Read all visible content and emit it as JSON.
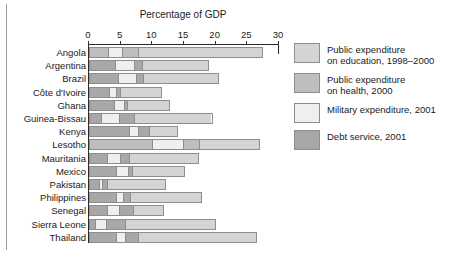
{
  "chart_data": {
    "type": "bar",
    "orientation": "horizontal",
    "stacked": true,
    "title": "Percentage of GDP",
    "xlabel": "Percentage of GDP",
    "ylabel": "",
    "xlim": [
      0,
      30
    ],
    "xticks": [
      0,
      5,
      10,
      15,
      20,
      25,
      30
    ],
    "xtick_labels": [
      "0",
      "5",
      "10",
      "15",
      "20",
      "25",
      "30"
    ],
    "grid": false,
    "legend_position": "right",
    "categories": [
      "Angola",
      "Argentina",
      "Brazil",
      "Côte d'Ivoire",
      "Ghana",
      "Guinea-Bissau",
      "Kenya",
      "Lesotho",
      "Mauritania",
      "Mexico",
      "Pakistan",
      "Philippines",
      "Senegal",
      "Sierra Leone",
      "Thailand"
    ],
    "series": [
      {
        "name": "Debt service, 2001",
        "key": "debt",
        "color": "#a8a8a8",
        "values": [
          3.0,
          4.2,
          4.7,
          3.2,
          4.1,
          2.0,
          6.4,
          0.0,
          2.9,
          4.3,
          1.6,
          4.4,
          3.0,
          1.0,
          4.3
        ]
      },
      {
        "name": "Military expenditure, 2001",
        "key": "military",
        "color": "#efefef",
        "values": [
          2.2,
          1.5,
          1.4,
          1.2,
          0.8,
          2.8,
          1.5,
          0.0,
          2.1,
          0.6,
          0.5,
          1.0,
          1.5,
          1.8,
          1.5
        ]
      },
      {
        "name": "Public expenditure on health, 2000",
        "key": "health",
        "color": "#bebebe",
        "values": [
          2.7,
          4.9,
          3.0,
          1.2,
          2.3,
          2.5,
          1.8,
          10.0,
          1.4,
          2.5,
          0.9,
          1.7,
          2.6,
          2.9,
          2.1
        ]
      },
      {
        "name": "Public expenditure on education, 1998–2000",
        "key": "education",
        "color": "#d4d4d4",
        "values": [
          19.6,
          8.4,
          11.4,
          5.9,
          5.6,
          12.2,
          4.4,
          17.0,
          10.9,
          7.8,
          9.2,
          10.7,
          4.8,
          14.3,
          18.6
        ]
      }
    ],
    "lesotho_segment_order": [
      "health",
      "military",
      "health",
      "education"
    ],
    "totals": [
      27.5,
      19.0,
      20.5,
      11.5,
      12.8,
      19.5,
      14.1,
      27.0,
      17.3,
      15.2,
      12.2,
      17.8,
      11.9,
      20.0,
      26.5
    ]
  },
  "chart": {
    "title": "Percentage of GDP",
    "ticks": [
      {
        "label": "0",
        "value": 0
      },
      {
        "label": "5",
        "value": 5
      },
      {
        "label": "10",
        "value": 10
      },
      {
        "label": "15",
        "value": 15
      },
      {
        "label": "20",
        "value": 20
      },
      {
        "label": "25",
        "value": 25
      },
      {
        "label": "30",
        "value": 30
      }
    ],
    "rows": [
      {
        "label": "Angola",
        "segments": [
          {
            "key": "health",
            "v": 3.0
          },
          {
            "key": "military",
            "v": 2.2
          },
          {
            "key": "health",
            "v": 2.7
          },
          {
            "key": "education",
            "v": 19.6
          }
        ]
      },
      {
        "label": "Argentina",
        "segments": [
          {
            "key": "debt",
            "v": 4.2
          },
          {
            "key": "military",
            "v": 3.0
          },
          {
            "key": "debt",
            "v": 1.3
          },
          {
            "key": "education",
            "v": 10.5
          }
        ]
      },
      {
        "label": "Brazil",
        "segments": [
          {
            "key": "debt",
            "v": 4.7
          },
          {
            "key": "military",
            "v": 2.9
          },
          {
            "key": "debt",
            "v": 1.0
          },
          {
            "key": "education",
            "v": 11.9
          }
        ]
      },
      {
        "label": "Côte d'Ivoire",
        "segments": [
          {
            "key": "debt",
            "v": 3.2
          },
          {
            "key": "military",
            "v": 1.2
          },
          {
            "key": "debt",
            "v": 0.6
          },
          {
            "key": "education",
            "v": 6.5
          }
        ]
      },
      {
        "label": "Ghana",
        "segments": [
          {
            "key": "debt",
            "v": 4.1
          },
          {
            "key": "military",
            "v": 1.5
          },
          {
            "key": "debt",
            "v": 0.5
          },
          {
            "key": "education",
            "v": 6.7
          }
        ]
      },
      {
        "label": "Guinea-Bissau",
        "segments": [
          {
            "key": "debt",
            "v": 2.0
          },
          {
            "key": "military",
            "v": 2.8
          },
          {
            "key": "debt",
            "v": 2.5
          },
          {
            "key": "education",
            "v": 12.2
          }
        ]
      },
      {
        "label": "Kenya",
        "segments": [
          {
            "key": "debt",
            "v": 6.4
          },
          {
            "key": "military",
            "v": 1.5
          },
          {
            "key": "debt",
            "v": 1.8
          },
          {
            "key": "education",
            "v": 4.4
          }
        ]
      },
      {
        "label": "Lesotho",
        "segments": [
          {
            "key": "health",
            "v": 10.0
          },
          {
            "key": "military",
            "v": 5.0
          },
          {
            "key": "health",
            "v": 2.5
          },
          {
            "key": "education",
            "v": 9.5
          }
        ]
      },
      {
        "label": "Mauritania",
        "segments": [
          {
            "key": "debt",
            "v": 2.9
          },
          {
            "key": "military",
            "v": 2.1
          },
          {
            "key": "debt",
            "v": 1.4
          },
          {
            "key": "education",
            "v": 10.9
          }
        ]
      },
      {
        "label": "Mexico",
        "segments": [
          {
            "key": "debt",
            "v": 4.3
          },
          {
            "key": "military",
            "v": 2.0
          },
          {
            "key": "debt",
            "v": 0.6
          },
          {
            "key": "education",
            "v": 8.3
          }
        ]
      },
      {
        "label": "Pakistan",
        "segments": [
          {
            "key": "debt",
            "v": 1.6
          },
          {
            "key": "military",
            "v": 0.5
          },
          {
            "key": "debt",
            "v": 0.9
          },
          {
            "key": "education",
            "v": 9.2
          }
        ]
      },
      {
        "label": "Philippines",
        "segments": [
          {
            "key": "debt",
            "v": 4.4
          },
          {
            "key": "military",
            "v": 1.0
          },
          {
            "key": "debt",
            "v": 1.2
          },
          {
            "key": "education",
            "v": 11.2
          }
        ]
      },
      {
        "label": "Senegal",
        "segments": [
          {
            "key": "debt",
            "v": 3.0
          },
          {
            "key": "military",
            "v": 1.8
          },
          {
            "key": "debt",
            "v": 2.3
          },
          {
            "key": "education",
            "v": 4.8
          }
        ]
      },
      {
        "label": "Sierra Leone",
        "segments": [
          {
            "key": "debt",
            "v": 1.0
          },
          {
            "key": "military",
            "v": 1.8
          },
          {
            "key": "debt",
            "v": 2.9
          },
          {
            "key": "education",
            "v": 14.3
          }
        ]
      },
      {
        "label": "Thailand",
        "segments": [
          {
            "key": "debt",
            "v": 4.3
          },
          {
            "key": "military",
            "v": 1.5
          },
          {
            "key": "debt",
            "v": 2.1
          },
          {
            "key": "education",
            "v": 18.6
          }
        ]
      }
    ]
  },
  "legend": {
    "items": [
      {
        "key": "education",
        "color": "#d4d4d4",
        "label": "Public expenditure\non education, 1998–2000"
      },
      {
        "key": "health",
        "color": "#bebebe",
        "label": "Public expenditure\non health, 2000"
      },
      {
        "key": "military",
        "color": "#efefef",
        "label": "Military expenditure, 2001"
      },
      {
        "key": "debt",
        "color": "#a8a8a8",
        "label": "Debt service, 2001"
      }
    ]
  }
}
